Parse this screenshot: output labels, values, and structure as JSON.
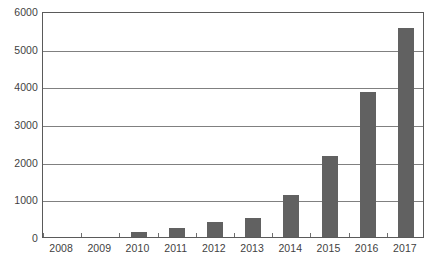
{
  "chart_data": {
    "type": "bar",
    "title": "",
    "subtitle": "",
    "xlabel": "",
    "ylabel": "",
    "categories": [
      "2008",
      "2009",
      "2010",
      "2011",
      "2012",
      "2013",
      "2014",
      "2015",
      "2016",
      "2017"
    ],
    "values": [
      0,
      0,
      130,
      240,
      400,
      500,
      1120,
      2150,
      3860,
      5550
    ],
    "series": [
      {
        "name": "",
        "values": [
          0,
          0,
          130,
          240,
          400,
          500,
          1120,
          2150,
          3860,
          5550
        ]
      }
    ],
    "ylim": [
      0,
      6000
    ],
    "y_ticks": [
      0,
      1000,
      2000,
      3000,
      4000,
      5000,
      6000
    ],
    "y_tick_labels": [
      "0",
      "1000",
      "2000",
      "3000",
      "4000",
      "5000",
      "6000"
    ],
    "grid": true,
    "grid_axis": "y",
    "legend": false,
    "legend_position": "none",
    "bar_color": "#616161",
    "axis_color": "#5a5a5a",
    "gridline_color": "#808080",
    "tick_label_color": "#3f3f3f",
    "plot_background": "#ffffff"
  }
}
